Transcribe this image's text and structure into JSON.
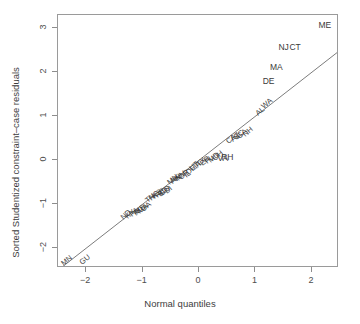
{
  "chart_data": {
    "type": "scatter",
    "title": "",
    "xlabel": "Normal quantiles",
    "ylabel": "Sorted Studentized constraint–case residuals",
    "xlim": [
      -2.5,
      2.48
    ],
    "ylim": [
      -2.45,
      3.3
    ],
    "xticks": [
      -2,
      -1,
      0,
      1,
      2
    ],
    "xticklabels": [
      "−2",
      "−1",
      "0",
      "1",
      "2"
    ],
    "yticks": [
      -2,
      -1,
      0,
      1,
      2,
      3
    ],
    "yticklabels": [
      "−2",
      "−1",
      "0",
      "1",
      "2",
      "3"
    ],
    "grid": false,
    "legend": null,
    "reference_line": {
      "type": "qq-line",
      "slope": 1.0,
      "intercept": 0.0,
      "x_start": -2.43,
      "y_start": -2.43,
      "x_end": 2.45,
      "y_end": 2.45
    },
    "label_rotation_deg": -40,
    "points": [
      {
        "label": "MN",
        "x": -2.33,
        "y": -2.36
      },
      {
        "label": "GU",
        "x": -2.0,
        "y": -2.33
      },
      {
        "label": "ND",
        "x": -1.28,
        "y": -1.32
      },
      {
        "label": "KY",
        "x": -1.2,
        "y": -1.29
      },
      {
        "label": "PA",
        "x": -1.13,
        "y": -1.24
      },
      {
        "label": "RI",
        "x": -1.08,
        "y": -1.22
      },
      {
        "label": "MS",
        "x": -1.03,
        "y": -1.2
      },
      {
        "label": "MA",
        "x": -0.98,
        "y": -1.18
      },
      {
        "label": "OA",
        "x": -0.93,
        "y": -1.13
      },
      {
        "label": "TN",
        "x": -0.85,
        "y": -0.93
      },
      {
        "label": "NC",
        "x": -0.78,
        "y": -0.88
      },
      {
        "label": "KS",
        "x": -0.73,
        "y": -0.84
      },
      {
        "label": "NE",
        "x": -0.68,
        "y": -0.81
      },
      {
        "label": "SD",
        "x": -0.63,
        "y": -0.78
      },
      {
        "label": "CO",
        "x": -0.58,
        "y": -0.76
      },
      {
        "label": "DI",
        "x": -0.53,
        "y": -0.73
      },
      {
        "label": "MN",
        "x": -0.45,
        "y": -0.52
      },
      {
        "label": "AK",
        "x": -0.4,
        "y": -0.49
      },
      {
        "label": "WI",
        "x": -0.35,
        "y": -0.46
      },
      {
        "label": "NV",
        "x": -0.3,
        "y": -0.43
      },
      {
        "label": "OR",
        "x": -0.25,
        "y": -0.4
      },
      {
        "label": "IL",
        "x": -0.2,
        "y": -0.36
      },
      {
        "label": "DE",
        "x": -0.13,
        "y": -0.3
      },
      {
        "label": "UT",
        "x": -0.08,
        "y": -0.2
      },
      {
        "label": "IA",
        "x": -0.02,
        "y": -0.15
      },
      {
        "label": "TX",
        "x": 0.05,
        "y": -0.1
      },
      {
        "label": "ER",
        "x": 0.12,
        "y": -0.08
      },
      {
        "label": "FL",
        "x": 0.2,
        "y": -0.05
      },
      {
        "label": "MD",
        "x": 0.28,
        "y": -0.02
      },
      {
        "label": "OH",
        "x": 0.35,
        "y": 0.02
      },
      {
        "label": "VA",
        "x": 0.42,
        "y": 0.05
      },
      {
        "label": "RH",
        "x": 0.5,
        "y": 0.08
      },
      {
        "label": "CA",
        "x": 0.58,
        "y": 0.42
      },
      {
        "label": "AZ",
        "x": 0.65,
        "y": 0.46
      },
      {
        "label": "SC",
        "x": 0.72,
        "y": 0.5
      },
      {
        "label": "GA",
        "x": 0.78,
        "y": 0.53
      },
      {
        "label": "NH",
        "x": 0.88,
        "y": 0.58
      },
      {
        "label": "AL",
        "x": 1.1,
        "y": 1.06
      },
      {
        "label": "WA",
        "x": 1.22,
        "y": 1.22
      },
      {
        "label": "DE",
        "x": 1.23,
        "y": 1.8
      },
      {
        "label": "MA",
        "x": 1.37,
        "y": 2.12
      },
      {
        "label": "NJ",
        "x": 1.5,
        "y": 2.58
      },
      {
        "label": "CT",
        "x": 1.7,
        "y": 2.58
      },
      {
        "label": "ME",
        "x": 2.23,
        "y": 3.08
      }
    ]
  },
  "colors": {
    "axis": "#8d8d8d",
    "frame": "#9a9a9a",
    "text": "#3a3a3a",
    "line": "#7c7c7c",
    "background": "#ffffff"
  }
}
